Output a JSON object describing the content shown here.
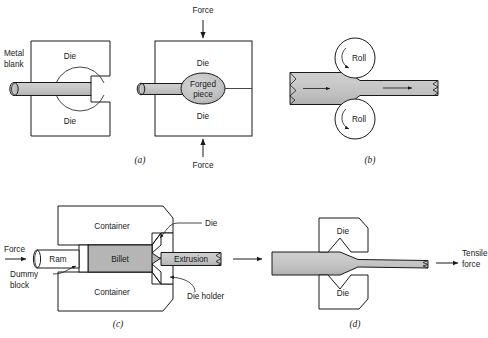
{
  "figure": {
    "colors": {
      "metal_fill": "#c0c0c0",
      "metal_fill_light": "#d4d4d4",
      "billet_fill": "#b5b5b5",
      "outline": "#1a1a1a",
      "background": "#ffffff"
    },
    "panels": [
      {
        "id": "a",
        "caption": "(a)",
        "process": "forging",
        "labels": {
          "metal_blank": "Metal\nblank",
          "metal_blank_line1": "Metal",
          "metal_blank_line2": "blank",
          "die_top_left": "Die",
          "die_bottom_left": "Die",
          "die_top_right": "Die",
          "die_bottom_right": "Die",
          "forged_piece_line1": "Forged",
          "forged_piece_line2": "piece",
          "force_top": "Force",
          "force_bottom": "Force"
        }
      },
      {
        "id": "b",
        "caption": "(b)",
        "process": "rolling",
        "labels": {
          "roll_top": "Roll",
          "roll_bottom": "Roll"
        }
      },
      {
        "id": "c",
        "caption": "(c)",
        "process": "extrusion",
        "labels": {
          "force": "Force",
          "ram": "Ram",
          "dummy_block_line1": "Dummy",
          "dummy_block_line2": "block",
          "container_top": "Container",
          "container_bottom": "Container",
          "billet": "Billet",
          "extrusion": "Extrusion",
          "die": "Die",
          "die_holder": "Die holder"
        }
      },
      {
        "id": "d",
        "caption": "(d)",
        "process": "drawing",
        "labels": {
          "die_top": "Die",
          "die_bottom": "Die",
          "tensile_force_line1": "Tensile",
          "tensile_force_line2": "force"
        }
      }
    ]
  }
}
